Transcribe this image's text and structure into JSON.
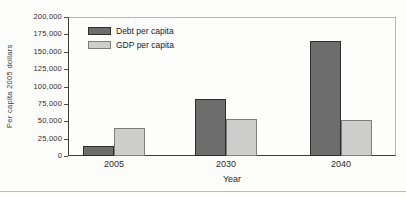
{
  "chart_data": {
    "type": "bar",
    "categories": [
      "2005",
      "2030",
      "2040"
    ],
    "series": [
      {
        "name": "Debt per capita",
        "values": [
          15000,
          82000,
          165000
        ],
        "fill": "#6d6d6d",
        "border": "#2e2e2e"
      },
      {
        "name": "GDP per capita",
        "values": [
          40000,
          53000,
          52000
        ],
        "fill": "#cdcdcb",
        "border": "#7d7d7d"
      }
    ],
    "xlabel": "Year",
    "ylabel": "Per capita 2005 dollars",
    "ylim": [
      0,
      200000
    ],
    "ytick_step": 25000,
    "ytick_labels": [
      "0",
      "25,000",
      "50,000",
      "75,000",
      "100,000",
      "125,000",
      "150,000",
      "175,000",
      "200,000"
    ],
    "legend_position": "top-left-inside",
    "grid": false,
    "axis_color": "#3c3c3c",
    "frame_color": "#b6b6b2"
  }
}
